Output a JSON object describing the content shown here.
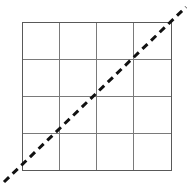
{
  "figure": {
    "title": "",
    "background_color": "#ffffff",
    "width": 190,
    "height": 184
  },
  "chart_data": {
    "type": "line",
    "title": "",
    "subtitle": "",
    "xlabel": "",
    "ylabel": "",
    "xlim": [
      0,
      4
    ],
    "ylim": [
      0,
      4
    ],
    "xticks": [
      0,
      1,
      2,
      3,
      4
    ],
    "yticks": [
      0,
      1,
      2,
      3,
      4
    ],
    "xticklabels": [
      "",
      "",
      "",
      "",
      ""
    ],
    "yticklabels": [
      "",
      "",
      "",
      "",
      ""
    ],
    "grid": true,
    "grid_rows": 4,
    "grid_columns": 4,
    "legend": null,
    "legend_position": "none",
    "annotations": [],
    "series": [
      {
        "name": "diagonal",
        "type": "line",
        "linestyle": "dashed",
        "color": "#111111",
        "linewidth": 3,
        "dash_length": 7,
        "dash_gap": 5,
        "x": [
          -0.5,
          4.4
        ],
        "y": [
          -0.35,
          4.4
        ],
        "slope": 1,
        "intercept": 0,
        "clipped_to_axes": false
      }
    ]
  },
  "plot_geometry": {
    "axes_left": 22,
    "axes_top": 22,
    "axes_right": 171,
    "axes_bottom": 170,
    "cell_width": 37.25,
    "cell_height": 37,
    "vertical_line_positions": [
      22,
      59.25,
      96.5,
      133.75,
      171
    ],
    "horizontal_line_positions": [
      22,
      59,
      96,
      133,
      170
    ],
    "diagonal_start": {
      "x": 4,
      "y": 182
    },
    "diagonal_end": {
      "x": 186,
      "y": 7
    }
  },
  "style": {
    "grid_border_color": "#595959",
    "grid_inner_color": "#7a7a7a",
    "grid_line_width": 1,
    "diagonal_color": "#111111",
    "diagonal_width": 3
  }
}
